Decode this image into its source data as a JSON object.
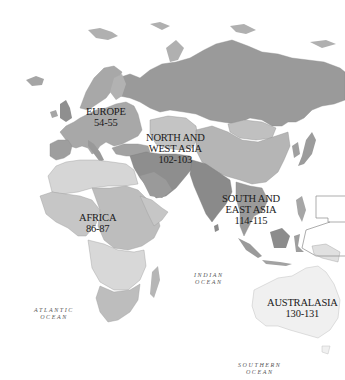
{
  "map": {
    "colors": {
      "background": "#ffffff",
      "russia": "#9a9a9a",
      "europe": "#a8a8a8",
      "middle_east": "#8e8e8e",
      "china": "#b5b5b5",
      "africa_light": "#d6d6d6",
      "africa_mid": "#bdbdbd",
      "south_asia": "#8a8a8a",
      "australia": "#f0f0f0",
      "outline": "#7a7a7a"
    },
    "regions": [
      {
        "id": "europe",
        "name": "EUROPE",
        "pages": "54-55"
      },
      {
        "id": "north-west-asia",
        "name_lines": [
          "NORTH AND",
          "WEST ASIA"
        ],
        "pages": "102-103"
      },
      {
        "id": "africa",
        "name": "AFRICA",
        "pages": "86-87"
      },
      {
        "id": "south-east-asia",
        "name_lines": [
          "SOUTH AND",
          "EAST ASIA"
        ],
        "pages": "114-115"
      },
      {
        "id": "australasia",
        "name": "AUSTRALASIA",
        "pages": "130-131"
      }
    ],
    "oceans": [
      {
        "id": "atlantic",
        "lines": [
          "ATLANTIC",
          "OCEAN"
        ]
      },
      {
        "id": "indian",
        "lines": [
          "INDIAN",
          "OCEAN"
        ]
      },
      {
        "id": "southern",
        "lines": [
          "SOUTHERN",
          "OCEAN"
        ]
      }
    ]
  }
}
